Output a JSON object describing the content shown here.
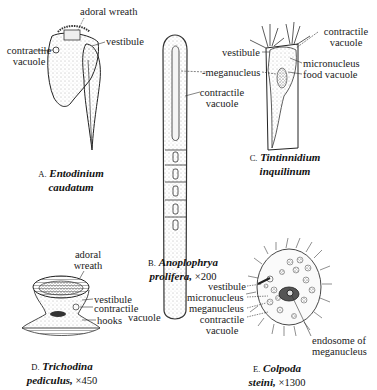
{
  "figures": [
    {
      "id": "A",
      "letter": "A.",
      "genus": "Entodinium",
      "species": "caudatum",
      "magnification": "",
      "labels": {
        "adoral_wreath": "adoral wreath",
        "vestibule": "vestibule",
        "contractile_vacuole_1": "contractile",
        "contractile_vacuole_2": "vacuole"
      }
    },
    {
      "id": "B",
      "letter": "B.",
      "genus": "Anoplophrya",
      "species": "prolifera,",
      "magnification": "×200",
      "labels": {
        "meganucleus": "-meganucleus",
        "contractile_vacuole_1": "contractile",
        "contractile_vacuole_2": "vacuole"
      }
    },
    {
      "id": "C",
      "letter": "C.",
      "genus": "Tintinnidium",
      "species": "inquilinum",
      "magnification": "",
      "labels": {
        "contractile_vacuole_1": "contractile",
        "contractile_vacuole_2": "vacuole",
        "vestibule": "vestibule",
        "micronucleus": "micronucleus",
        "food_vacuole": "food vacuole"
      }
    },
    {
      "id": "D",
      "letter": "D.",
      "genus": "Trichodina",
      "species": "pediculus,",
      "magnification": "×450",
      "labels": {
        "adoral_1": "adoral",
        "adoral_2": "wreath",
        "vestibule": "vestibule",
        "contractile_1": "contractile",
        "contractile_2": "vacuole",
        "hooks": "hooks"
      }
    },
    {
      "id": "E",
      "letter": "E.",
      "genus": "Colpoda",
      "species": "steini,",
      "magnification": "×1300",
      "labels": {
        "vestibule": "vestibule",
        "micronucleus": "micronucleus",
        "meganucleus": "meganucleus",
        "contractile_1": "contractile",
        "contractile_2": "vacuole",
        "endosome_1": "endosome of",
        "endosome_2": "meganucleus"
      }
    }
  ],
  "colors": {
    "ink": "#1a1a1a",
    "stipple": "#555555",
    "background": "#ffffff"
  }
}
